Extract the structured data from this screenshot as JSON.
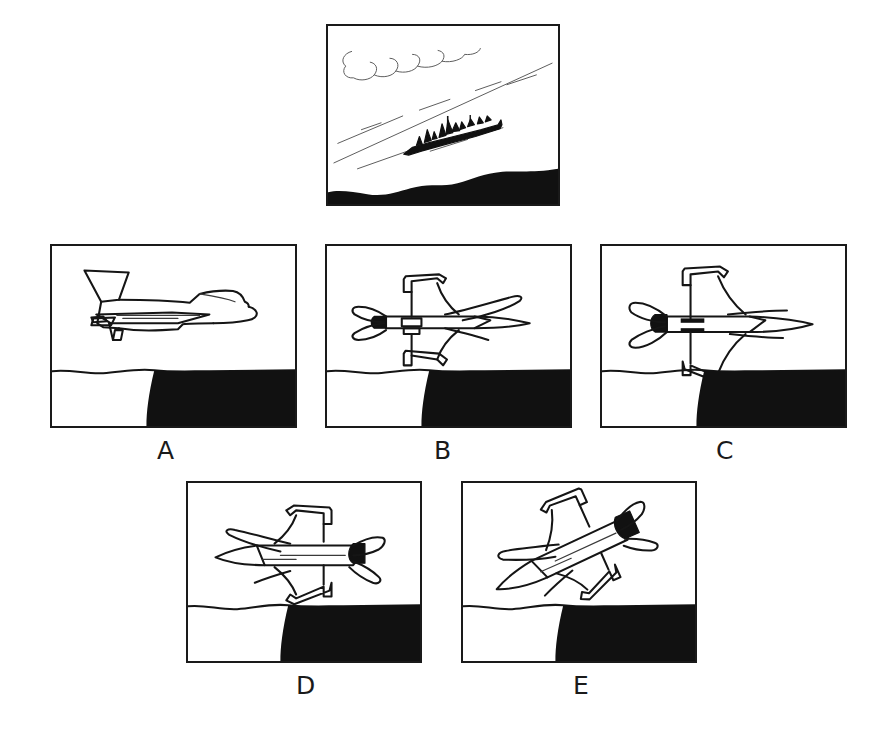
{
  "item": {
    "type": "spatial-orientation-multiple-choice",
    "question_format": "reference-view-then-five-options",
    "panel_count": 6
  },
  "stimulus": {
    "name": "reference-scene",
    "description": "Aerial oblique view of a naval warship underway on water, seen from an aircraft; cloud at upper left, coastline ridge along the bottom",
    "elements": [
      {
        "name": "cloud",
        "description": "single outlined cumulus cloud, upper left"
      },
      {
        "name": "shoreline-diagonal",
        "description": "long diagonal line of the coast running from lower left to upper right"
      },
      {
        "name": "warship",
        "description": "solid black destroyer silhouette with masts and superstructure, bow pointing upper right"
      },
      {
        "name": "wake-marks",
        "description": "short broken lines indicating water wake and surface texture"
      },
      {
        "name": "land-mass",
        "description": "solid black landform along the bottom edge"
      }
    ]
  },
  "options": [
    {
      "id": "A",
      "label": "A",
      "name": "option-a",
      "aircraft": "F-16 fighter jet",
      "orientation": "level side view, nose pointing right, viewed from the left side",
      "scene": "wavy horizon line with solid black landmass occupying the lower right"
    },
    {
      "id": "B",
      "label": "B",
      "name": "option-b",
      "aircraft": "F-16 fighter jet",
      "orientation": "rear three-quarter view from above, nose pointing right and away, exhaust nozzle facing viewer at left",
      "scene": "wavy horizon line with solid black landmass occupying the lower right"
    },
    {
      "id": "C",
      "label": "C",
      "name": "option-c",
      "aircraft": "F-16 fighter jet",
      "orientation": "rear view from below, nose pointing right with pointed nose cone, exhaust nozzle facing viewer at left",
      "scene": "wavy horizon line with solid black landmass occupying the lower right"
    },
    {
      "id": "D",
      "label": "D",
      "name": "option-d",
      "aircraft": "F-16 fighter jet",
      "orientation": "rear view, nose pointing left, exhaust nozzle facing viewer at right",
      "scene": "wavy horizon line with solid black landmass occupying the lower right"
    },
    {
      "id": "E",
      "label": "E",
      "name": "option-e",
      "aircraft": "F-16 fighter jet",
      "orientation": "banked oblique view diving toward lower left, nose pointing down-left, exhaust nozzle at upper right",
      "scene": "wavy horizon line with solid black landmass occupying the lower right"
    }
  ],
  "colors": {
    "ink": "#151515",
    "fill_black": "#111111",
    "background": "#ffffff",
    "thin_line": "#3a3a3a"
  }
}
